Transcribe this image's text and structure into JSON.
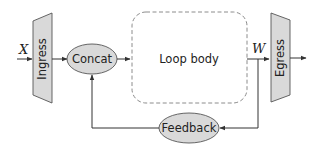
{
  "diagram": {
    "inputs": {
      "x_label": "X",
      "w_label": "W"
    },
    "nodes": {
      "ingress": "Ingress",
      "concat": "Concat",
      "loop_body": "Loop body",
      "egress": "Egress",
      "feedback": "Feedback"
    },
    "colors": {
      "node_fill": "#d9d9d9",
      "stroke": "#333333",
      "dashed_border": "#8c8c8c",
      "background": "#ffffff"
    },
    "edges": [
      {
        "from": "X",
        "to": "Ingress"
      },
      {
        "from": "Ingress",
        "to": "Concat"
      },
      {
        "from": "Concat",
        "to": "Loop body"
      },
      {
        "from": "Loop body",
        "to": "Egress",
        "label": "W"
      },
      {
        "from": "Egress",
        "to": "output"
      },
      {
        "from": "W",
        "to": "Feedback"
      },
      {
        "from": "Feedback",
        "to": "Concat"
      }
    ]
  }
}
